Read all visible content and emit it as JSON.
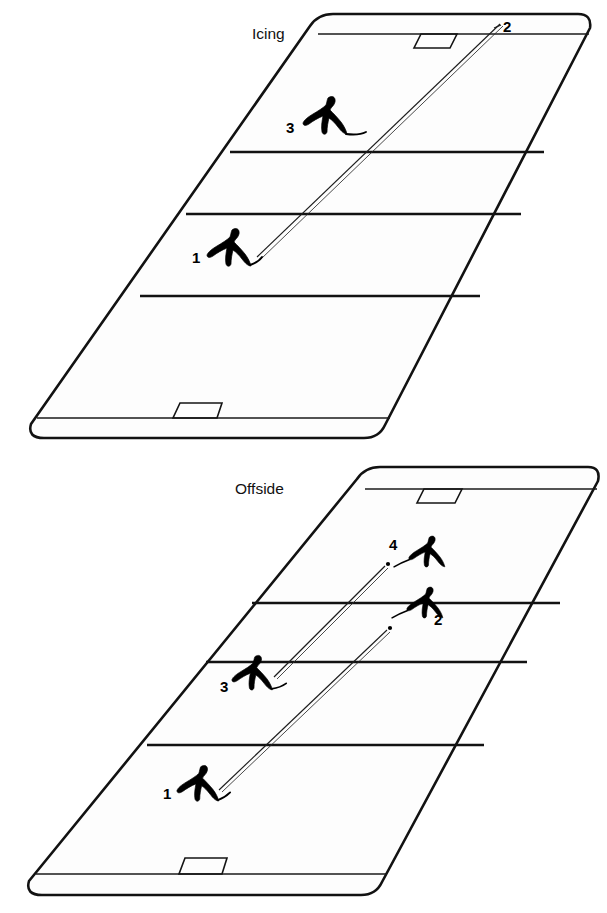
{
  "page": {
    "background_color": "#ffffff",
    "ink_color": "#121212",
    "width": 607,
    "height": 913
  },
  "diagrams": [
    {
      "id": "icing",
      "label": "Icing",
      "label_position": {
        "x": 252,
        "y": 38
      },
      "players": [
        {
          "number": "3",
          "label_x": 290,
          "label_y": 131,
          "figure_x": 315,
          "figure_y": 96
        },
        {
          "number": "1",
          "label_x": 196,
          "label_y": 261,
          "figure_x": 218,
          "figure_y": 228
        }
      ],
      "markers": [
        {
          "number": "2",
          "label_x": 504,
          "label_y": 32,
          "dash": "-"
        }
      ],
      "puck_paths": [
        {
          "from": "1",
          "to": "2",
          "style": "double-line"
        }
      ],
      "goals": [
        {
          "position": "far",
          "x": 419,
          "y": 30
        },
        {
          "position": "near",
          "x": 178,
          "y": 395
        }
      ],
      "rink_lines": [
        "goal-line-far",
        "blue-line-far",
        "center-line",
        "blue-line-near",
        "goal-line-near"
      ]
    },
    {
      "id": "offside",
      "label": "Offside",
      "label_position": {
        "x": 235,
        "y": 492
      },
      "players": [
        {
          "number": "4",
          "label_x": 393,
          "label_y": 548,
          "figure_x": 413,
          "figure_y": 536
        },
        {
          "number": "2",
          "label_x": 437,
          "label_y": 622,
          "figure_x": 410,
          "figure_y": 586
        },
        {
          "number": "3",
          "label_x": 224,
          "label_y": 690,
          "figure_x": 243,
          "figure_y": 655
        },
        {
          "number": "1",
          "label_x": 167,
          "label_y": 797,
          "figure_x": 187,
          "figure_y": 765
        }
      ],
      "markers": [],
      "puck_paths": [
        {
          "from": "3",
          "to": "4",
          "style": "double-line"
        },
        {
          "from": "1",
          "to": "2",
          "style": "double-line"
        }
      ],
      "goals": [
        {
          "position": "far",
          "x": 422,
          "y": 489
        },
        {
          "position": "near",
          "x": 182,
          "y": 853
        }
      ],
      "rink_lines": [
        "goal-line-far",
        "blue-line-far",
        "center-line",
        "blue-line-near",
        "goal-line-near"
      ]
    }
  ],
  "caption": {
    "icing": "Icing",
    "offside": "Offside"
  }
}
